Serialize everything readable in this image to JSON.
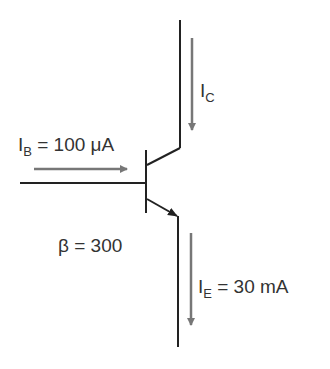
{
  "diagram": {
    "type": "npn-transistor",
    "labels": {
      "ic": {
        "main": "I",
        "sub": "C"
      },
      "ib": {
        "main": "I",
        "sub": "B",
        "value": " = 100 μA"
      },
      "ie": {
        "main": "I",
        "sub": "E",
        "value": " = 30 mA"
      },
      "beta": "β = 300"
    },
    "colors": {
      "wire": "#222222",
      "arrow": "#777777",
      "text": "#333333"
    }
  }
}
